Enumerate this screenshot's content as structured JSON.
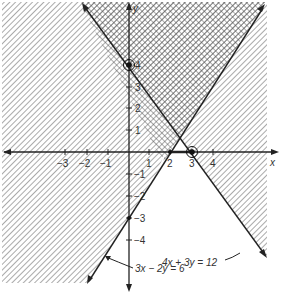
{
  "figure": {
    "type": "system-of-linear-inequalities",
    "axes": {
      "x_label": "x",
      "y_label": "y",
      "x_ticks": [
        {
          "value": -3,
          "label": "−3"
        },
        {
          "value": -2,
          "label": "−2"
        },
        {
          "value": -1,
          "label": "−1"
        },
        {
          "value": 1,
          "label": "1"
        },
        {
          "value": 2,
          "label": "2"
        },
        {
          "value": 3,
          "label": "3"
        },
        {
          "value": 4,
          "label": "4"
        }
      ],
      "y_ticks": [
        {
          "value": 4,
          "label": "4"
        },
        {
          "value": 3,
          "label": "3"
        },
        {
          "value": 2,
          "label": "2"
        },
        {
          "value": 1,
          "label": "1"
        },
        {
          "value": -1,
          "label": "−1"
        },
        {
          "value": -2,
          "label": "−2"
        },
        {
          "value": -3,
          "label": "−3"
        },
        {
          "value": -4,
          "label": "−4"
        }
      ]
    },
    "lines": [
      {
        "equation": "4x + 3y = 12",
        "label": "4x + 3y = 12",
        "shaded_side": "4x + 3y ≥ 12"
      },
      {
        "equation": "3x − 2y = 6",
        "label": "3x − 2y = 6",
        "shaded_side": "3x − 2y ≤ 6"
      }
    ],
    "points": [
      {
        "name": "y-intercept of 4x+3y=12",
        "x": 0,
        "y": 4,
        "circled": true
      },
      {
        "name": "x-intercept of 4x+3y=12",
        "x": 3,
        "y": 0,
        "circled": true
      },
      {
        "name": "x-intercept of 3x-2y=6",
        "x": 2,
        "y": 0,
        "circled": false
      },
      {
        "name": "y-intercept of 3x-2y=6",
        "x": 0,
        "y": -3,
        "circled": false
      }
    ],
    "solution_region": "crosshatched region where both inequalities hold"
  }
}
